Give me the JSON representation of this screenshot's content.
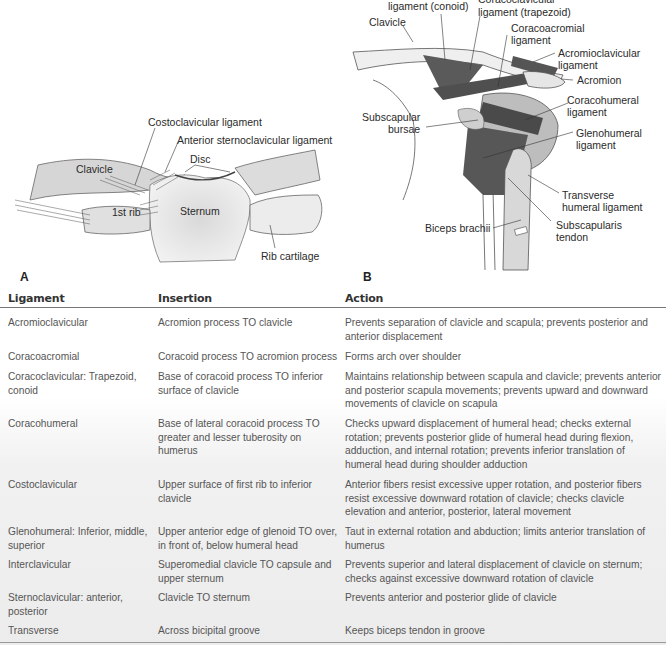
{
  "figure_a": {
    "panel_letter": "A",
    "labels": {
      "costoclavicular": "Costoclavicular ligament",
      "anterior_sternoclavicular": "Anterior sternoclavicular ligament",
      "disc": "Disc",
      "clavicle": "Clavicle",
      "first_rib": "1st rib",
      "sternum": "Sternum",
      "rib_cartilage": "Rib cartilage"
    }
  },
  "figure_b": {
    "panel_letter": "B",
    "labels": {
      "coracoclavicular_conoid": "ligament (conoid)",
      "coracoclavicular_trapezoid_1": "Coracoclavicular",
      "coracoclavicular_trapezoid_2": "ligament (trapezoid)",
      "clavicle": "Clavicle",
      "coracoacromial_1": "Coracoacromial",
      "coracoacromial_2": "ligament",
      "acromioclavicular_1": "Acromioclavicular",
      "acromioclavicular_2": "ligament",
      "acromion": "Acromion",
      "coracohumeral_1": "Coracohumeral",
      "coracohumeral_2": "ligament",
      "subscapular_1": "Subscapular",
      "subscapular_2": "bursae",
      "glenohumeral_1": "Glenohumeral",
      "glenohumeral_2": "ligament",
      "transverse_1": "Transverse",
      "transverse_2": "humeral ligament",
      "biceps": "Biceps brachii",
      "subscapularis_1": "Subscapularis",
      "subscapularis_2": "tendon"
    }
  },
  "table": {
    "headers": [
      "Ligament",
      "Insertion",
      "Action"
    ],
    "rows": [
      {
        "ligament": "Acromioclavicular",
        "insertion": "Acromion process TO clavicle",
        "action": "Prevents separation of clavicle and scapula; prevents posterior and anterior displacement"
      },
      {
        "ligament": "Coracoacromial",
        "insertion": "Coracoid process TO acromion process",
        "action": "Forms arch over shoulder"
      },
      {
        "ligament": "Coracoclavicular: Trapezoid, conoid",
        "insertion": "Base of coracoid process TO inferior surface of clavicle",
        "action": "Maintains relationship between scapula and clavicle; prevents anterior and posterior scapula movements; prevents upward and downward movements of clavicle on scapula"
      },
      {
        "ligament": "Coracohumeral",
        "insertion": "Base of lateral coracoid process TO greater and lesser tuberosity on humerus",
        "action": "Checks upward displacement of humeral head; checks external rotation; prevents posterior glide of humeral head during flexion, adduction, and internal rotation; prevents inferior translation of humeral head during shoulder adduction"
      },
      {
        "ligament": "Costoclavicular",
        "insertion": "Upper surface of first rib to inferior clavicle",
        "action": "Anterior fibers resist excessive upper rotation, and posterior fibers resist excessive downward rotation of clavicle; checks clavicle elevation and anterior, posterior, lateral movement"
      },
      {
        "ligament": "Glenohumeral: Inferior, middle, superior",
        "insertion": "Upper anterior edge of glenoid TO over, in front of, below humeral head",
        "action": "Taut in external rotation and abduction; limits anterior translation of humerus"
      },
      {
        "ligament": "Interclavicular",
        "insertion": "Superomedial clavicle TO capsule and upper sternum",
        "action": "Prevents superior and lateral displacement of clavicle on sternum; checks against excessive downward rotation of clavicle"
      },
      {
        "ligament": "Sternoclavicular: anterior, posterior",
        "insertion": "Clavicle TO sternum",
        "action": "Prevents anterior and posterior glide of clavicle"
      },
      {
        "ligament": "Transverse",
        "insertion": "Across bicipital groove",
        "action": "Keeps biceps tendon in groove"
      }
    ]
  }
}
